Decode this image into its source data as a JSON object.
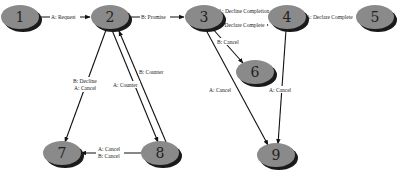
{
  "diagram": {
    "type": "state-transition",
    "node_color": "#8a8a8a",
    "shadow_color": "#1a1a1a",
    "edge_color": "#111111",
    "nodes": [
      {
        "id": "1",
        "label": "1",
        "x": 20,
        "y": 17
      },
      {
        "id": "2",
        "label": "2",
        "x": 110,
        "y": 17
      },
      {
        "id": "3",
        "label": "3",
        "x": 204,
        "y": 17
      },
      {
        "id": "4",
        "label": "4",
        "x": 287,
        "y": 17
      },
      {
        "id": "5",
        "label": "5",
        "x": 375,
        "y": 17
      },
      {
        "id": "6",
        "label": "6",
        "x": 255,
        "y": 72
      },
      {
        "id": "7",
        "label": "7",
        "x": 62,
        "y": 153
      },
      {
        "id": "8",
        "label": "8",
        "x": 160,
        "y": 153
      },
      {
        "id": "9",
        "label": "9",
        "x": 276,
        "y": 155
      }
    ],
    "edges": [
      {
        "from": "1",
        "to": "2",
        "label": "A: Request"
      },
      {
        "from": "2",
        "to": "3",
        "label": "B: Promise"
      },
      {
        "from": "4",
        "to": "3",
        "label": "A: Decline Completion"
      },
      {
        "from": "3",
        "to": "4",
        "label": "B: Declare Complete"
      },
      {
        "from": "4",
        "to": "5",
        "label": "A: Declare Complete"
      },
      {
        "from": "3",
        "to": "6",
        "label": "B: Cancel"
      },
      {
        "from": "3",
        "to": "9",
        "label": "A: Cancel"
      },
      {
        "from": "4",
        "to": "9",
        "label": "A: Cancel"
      },
      {
        "from": "2",
        "to": "7",
        "label": "B: Decline / A: Cancel",
        "label_lines": [
          "B: Decline",
          "A: Cancel"
        ]
      },
      {
        "from": "2",
        "to": "8",
        "label": "A: Counter"
      },
      {
        "from": "8",
        "to": "2",
        "label": "B: Counter"
      },
      {
        "from": "8",
        "to": "7",
        "label": "A: Cancel / B: Cancel",
        "label_lines": [
          "A: Cancel",
          "B: Cancel"
        ]
      }
    ]
  }
}
